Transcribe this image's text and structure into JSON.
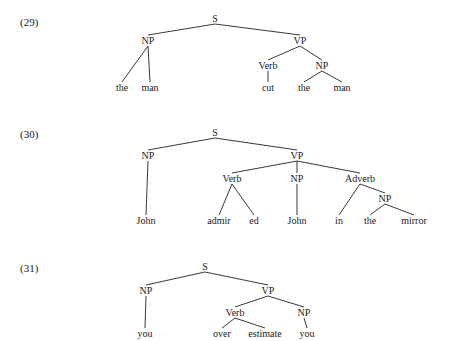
{
  "examples": [
    {
      "number": "(29)",
      "number_pos": [
        20,
        26
      ],
      "nodes": [
        {
          "id": "S",
          "label": "S",
          "x": 215,
          "y": 22
        },
        {
          "id": "NP",
          "label": "NP",
          "x": 148,
          "y": 44
        },
        {
          "id": "VP",
          "label": "VP",
          "x": 300,
          "y": 44
        },
        {
          "id": "the1",
          "label": "the",
          "x": 122,
          "y": 91
        },
        {
          "id": "man1",
          "label": "man",
          "x": 150,
          "y": 91
        },
        {
          "id": "Verb",
          "label": "Verb",
          "x": 268,
          "y": 69
        },
        {
          "id": "NP2",
          "label": "NP",
          "x": 322,
          "y": 69
        },
        {
          "id": "cut",
          "label": "cut",
          "x": 268,
          "y": 91
        },
        {
          "id": "the2",
          "label": "the",
          "x": 304,
          "y": 91
        },
        {
          "id": "man2",
          "label": "man",
          "x": 342,
          "y": 91
        }
      ],
      "edges": [
        [
          "S",
          "NP"
        ],
        [
          "S",
          "VP"
        ],
        [
          "NP",
          "the1"
        ],
        [
          "NP",
          "man1"
        ],
        [
          "VP",
          "Verb"
        ],
        [
          "VP",
          "NP2"
        ],
        [
          "Verb",
          "cut"
        ],
        [
          "NP2",
          "the2"
        ],
        [
          "NP2",
          "man2"
        ]
      ]
    },
    {
      "number": "(30)",
      "number_pos": [
        20,
        138
      ],
      "nodes": [
        {
          "id": "S",
          "label": "S",
          "x": 215,
          "y": 136
        },
        {
          "id": "NP",
          "label": "NP",
          "x": 148,
          "y": 159
        },
        {
          "id": "VP",
          "label": "VP",
          "x": 297,
          "y": 159
        },
        {
          "id": "John1",
          "label": "John",
          "x": 146,
          "y": 224
        },
        {
          "id": "Verb",
          "label": "Verb",
          "x": 232,
          "y": 182
        },
        {
          "id": "NP2",
          "label": "NP",
          "x": 297,
          "y": 182
        },
        {
          "id": "Adverb",
          "label": "Adverb",
          "x": 360,
          "y": 182
        },
        {
          "id": "admir",
          "label": "admir",
          "x": 219,
          "y": 224
        },
        {
          "id": "ed",
          "label": "ed",
          "x": 254,
          "y": 224
        },
        {
          "id": "John2",
          "label": "John",
          "x": 297,
          "y": 224
        },
        {
          "id": "in",
          "label": "in",
          "x": 339,
          "y": 224
        },
        {
          "id": "NP3",
          "label": "NP",
          "x": 385,
          "y": 202
        },
        {
          "id": "the",
          "label": "the",
          "x": 370,
          "y": 224
        },
        {
          "id": "mirror",
          "label": "mirror",
          "x": 414,
          "y": 224
        }
      ],
      "edges": [
        [
          "S",
          "NP"
        ],
        [
          "S",
          "VP"
        ],
        [
          "NP",
          "John1"
        ],
        [
          "VP",
          "Verb"
        ],
        [
          "VP",
          "NP2"
        ],
        [
          "VP",
          "Adverb"
        ],
        [
          "Verb",
          "admir"
        ],
        [
          "Verb",
          "ed"
        ],
        [
          "NP2",
          "John2"
        ],
        [
          "Adverb",
          "in"
        ],
        [
          "Adverb",
          "NP3"
        ],
        [
          "NP3",
          "the"
        ],
        [
          "NP3",
          "mirror"
        ]
      ]
    },
    {
      "number": "(31)",
      "number_pos": [
        20,
        272
      ],
      "nodes": [
        {
          "id": "S",
          "label": "S",
          "x": 205,
          "y": 270
        },
        {
          "id": "NP",
          "label": "NP",
          "x": 146,
          "y": 294
        },
        {
          "id": "VP",
          "label": "VP",
          "x": 268,
          "y": 294
        },
        {
          "id": "you1",
          "label": "you",
          "x": 145,
          "y": 337
        },
        {
          "id": "Verb",
          "label": "Verb",
          "x": 235,
          "y": 316
        },
        {
          "id": "NP2",
          "label": "NP",
          "x": 304,
          "y": 316
        },
        {
          "id": "over",
          "label": "over",
          "x": 222,
          "y": 337
        },
        {
          "id": "estimate",
          "label": "estimate",
          "x": 265,
          "y": 337
        },
        {
          "id": "you2",
          "label": "you",
          "x": 307,
          "y": 337
        }
      ],
      "edges": [
        [
          "S",
          "NP"
        ],
        [
          "S",
          "VP"
        ],
        [
          "NP",
          "you1"
        ],
        [
          "VP",
          "Verb"
        ],
        [
          "VP",
          "NP2"
        ],
        [
          "Verb",
          "over"
        ],
        [
          "Verb",
          "estimate"
        ],
        [
          "NP2",
          "you2"
        ]
      ]
    }
  ]
}
